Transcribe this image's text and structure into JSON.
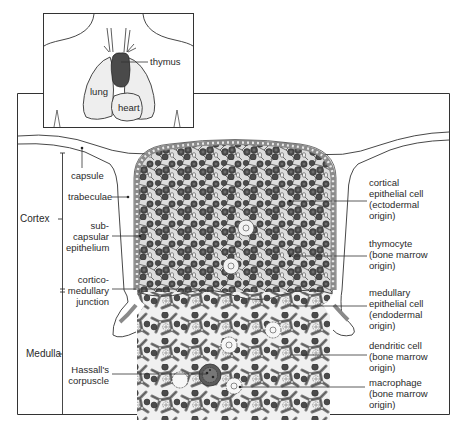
{
  "figure": {
    "inset": {
      "labels": {
        "thymus": "thymus",
        "lung": "lung",
        "heart": "heart"
      }
    },
    "regions": {
      "cortex": "Cortex",
      "medulla": "Medulla"
    },
    "left_labels": {
      "capsule": "capsule",
      "trabeculae": "trabeculae",
      "subcapsular": "sub-\ncapsular\nepithelium",
      "corticomedullary": "cortico-\nmedullary\njunction",
      "hassalls": "Hassall's\ncorpuscle"
    },
    "right_labels": {
      "cortical_epithelial": "cortical\nepithelial cell\n(ectodermal\norigin)",
      "thymocyte": "thymocyte\n(bone marrow\norigin)",
      "medullary_epithelial": "medullary\nepithelial cell\n(endodermal\norigin)",
      "dendritic": "dendritic cell\n(bone marrow\norigin)",
      "macrophage": "macrophage\n(bone marrow\norigin)"
    },
    "colors": {
      "line": "#2b2b2b",
      "thymus_fill": "#4a4a4a",
      "lung_fill": "#efefef",
      "tissue_bg": "#e4e4e4",
      "cell_dark": "#4b4b4b",
      "cell_mid": "#7a7a7a",
      "epithelial": "#8c8c8c",
      "pale": "#f3f3f3"
    }
  }
}
